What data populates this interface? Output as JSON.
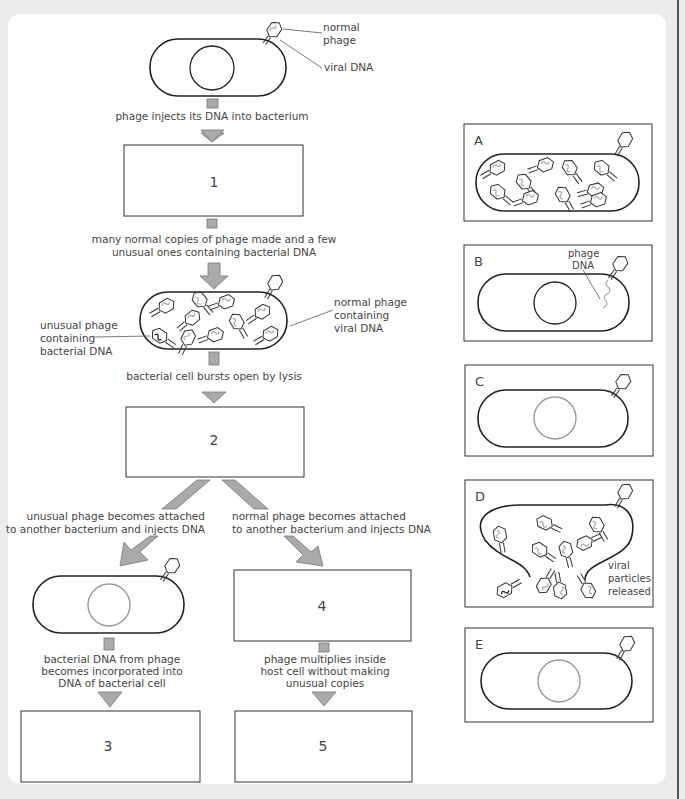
{
  "diagram": {
    "top_cell": {
      "labels": {
        "normal_phage": [
          "normal",
          "phage"
        ],
        "viral_dna": "viral DNA"
      }
    },
    "steps": {
      "inject": "phage injects its DNA into bacterium",
      "copies": [
        "many normal copies of phage made and a few",
        "unusual ones containing bacterial DNA"
      ],
      "lysis": "bacterial cell bursts open by lysis",
      "unusual_attach": [
        "unusual phage becomes attached",
        "to another bacterium and injects DNA"
      ],
      "normal_attach": [
        "normal phage becomes attached",
        "to another bacterium and injects DNA"
      ],
      "incorporated": [
        "bacterial DNA from phage",
        "becomes incorporated into",
        "DNA of bacterial cell"
      ],
      "multiplies": [
        "phage multiplies inside",
        "host cell without making",
        "unusual copies"
      ]
    },
    "lysing_cell": {
      "left_label": [
        "unusual phage",
        "containing",
        "bacterial DNA"
      ],
      "right_label": [
        "normal phage",
        "containing",
        "viral DNA"
      ]
    },
    "blank_boxes": [
      {
        "id": "1",
        "label": "1"
      },
      {
        "id": "2",
        "label": "2"
      },
      {
        "id": "3",
        "label": "3"
      },
      {
        "id": "4",
        "label": "4"
      },
      {
        "id": "5",
        "label": "5"
      }
    ],
    "options": [
      {
        "letter": "A",
        "desc": "bacterium full of phages"
      },
      {
        "letter": "B",
        "desc": "phage DNA injected",
        "label": [
          "phage",
          "DNA"
        ]
      },
      {
        "letter": "C",
        "desc": "phage attached, grey nucleus"
      },
      {
        "letter": "D",
        "desc": "lysis",
        "label": [
          "viral",
          "particles",
          "released"
        ]
      },
      {
        "letter": "E",
        "desc": "phage attached, grey nucleus"
      }
    ]
  },
  "colors": {
    "background": "#ececec",
    "panel": "#ffffff",
    "arrow_fill": "#aaaaaa",
    "text": "#444444",
    "viral_dna": "#aaaaaa"
  }
}
